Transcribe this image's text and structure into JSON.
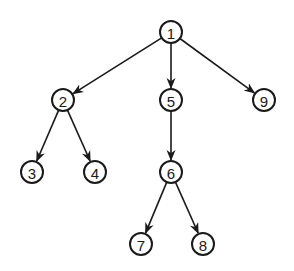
{
  "diagram": {
    "type": "tree",
    "colors": {
      "stroke": "#1a1a1a",
      "background": "#ffffff"
    },
    "nodes": [
      {
        "id": "1",
        "label": "1",
        "x": 171,
        "y": 32
      },
      {
        "id": "2",
        "label": "2",
        "x": 63,
        "y": 100
      },
      {
        "id": "5",
        "label": "5",
        "x": 171,
        "y": 100
      },
      {
        "id": "9",
        "label": "9",
        "x": 264,
        "y": 100
      },
      {
        "id": "3",
        "label": "3",
        "x": 32,
        "y": 172
      },
      {
        "id": "4",
        "label": "4",
        "x": 95,
        "y": 172
      },
      {
        "id": "6",
        "label": "6",
        "x": 171,
        "y": 172
      },
      {
        "id": "7",
        "label": "7",
        "x": 141,
        "y": 244
      },
      {
        "id": "8",
        "label": "8",
        "x": 203,
        "y": 244
      }
    ],
    "edges": [
      {
        "from": "1",
        "to": "2"
      },
      {
        "from": "1",
        "to": "5"
      },
      {
        "from": "1",
        "to": "9"
      },
      {
        "from": "2",
        "to": "3"
      },
      {
        "from": "2",
        "to": "4"
      },
      {
        "from": "5",
        "to": "6"
      },
      {
        "from": "6",
        "to": "7"
      },
      {
        "from": "6",
        "to": "8"
      }
    ]
  }
}
